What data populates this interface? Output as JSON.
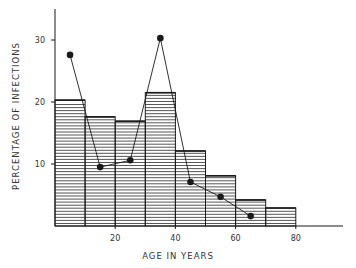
{
  "chart_data": {
    "type": "bar",
    "title": "",
    "xlabel": "AGE IN YEARS",
    "ylabel": "PERCENTAGE OF INFECTIONS",
    "xlim": [
      0,
      96
    ],
    "ylim": [
      0,
      35
    ],
    "x_ticks": [
      20,
      40,
      60,
      80
    ],
    "y_ticks": [
      10,
      20,
      30
    ],
    "grid": false,
    "legend": null,
    "bar_series": {
      "name": "Histogram (hatched)",
      "bins": [
        [
          0,
          10
        ],
        [
          10,
          20
        ],
        [
          20,
          30
        ],
        [
          30,
          40
        ],
        [
          40,
          50
        ],
        [
          50,
          60
        ],
        [
          60,
          70
        ],
        [
          70,
          80
        ]
      ],
      "values": [
        20.3,
        17.6,
        16.9,
        21.5,
        12.1,
        8.1,
        4.2,
        2.9
      ]
    },
    "line_series": {
      "name": "Points (line with markers)",
      "x": [
        5,
        15,
        25,
        35,
        45,
        55,
        65
      ],
      "values": [
        27.6,
        9.5,
        10.6,
        30.3,
        7.1,
        4.7,
        1.6
      ]
    }
  },
  "colors": {
    "ink": "#1a1a1a",
    "hatch": "#444444",
    "background": "#ffffff"
  }
}
